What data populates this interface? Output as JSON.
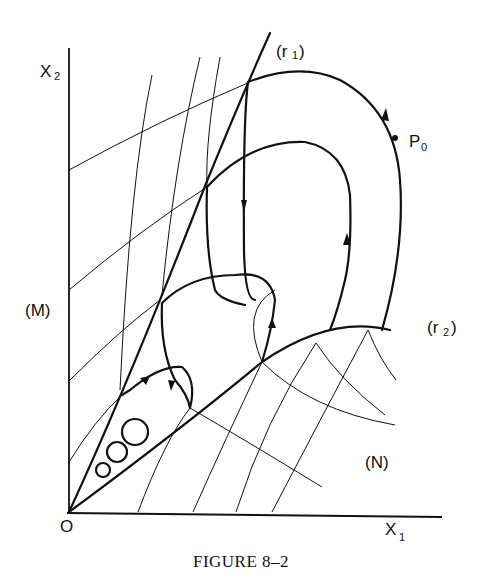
{
  "figure": {
    "caption": "Figure 8–2",
    "caption_display": "FIGURE 8–2"
  },
  "labels": {
    "x_axis": "X",
    "x_axis_sub": "1",
    "y_axis": "X",
    "y_axis_sub": "2",
    "origin": "O",
    "curve_r1": "(r",
    "curve_r1_sub": "1",
    "curve_r1_close": ")",
    "curve_r2": "(r",
    "curve_r2_sub": "2",
    "curve_r2_close": ")",
    "family_M": "(M)",
    "family_N": "(N)",
    "point": "P",
    "point_sub": "0"
  }
}
